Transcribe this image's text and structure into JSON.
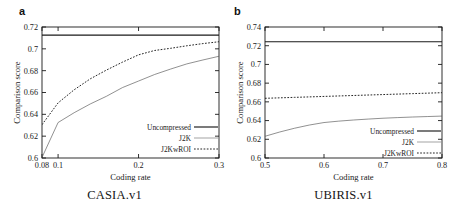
{
  "figure": {
    "panels": [
      {
        "letter": "a",
        "caption": "CASIA.v1",
        "chart_data": {
          "type": "line",
          "title": "",
          "xlabel": "Coding rate",
          "ylabel": "Comparison score",
          "xlim": [
            0.08,
            0.3
          ],
          "ylim": [
            0.6,
            0.72
          ],
          "xticks": [
            0.08,
            0.1,
            0.2,
            0.3
          ],
          "xticklabels": [
            "0.08",
            "0.1",
            "0.2",
            "0.3"
          ],
          "yticks": [
            0.6,
            0.62,
            0.64,
            0.66,
            0.68,
            0.7,
            0.72
          ],
          "yticklabels": [
            "0.6",
            "0.62",
            "0.64",
            "0.66",
            "0.68",
            "0.7",
            "0.72"
          ],
          "grid": false,
          "legend_position": "lower right",
          "series": [
            {
              "name": "Uncompressed",
              "style": "solid",
              "x": [
                0.08,
                0.3
              ],
              "values": [
                0.7125,
                0.7125
              ]
            },
            {
              "name": "J2K",
              "style": "thin-solid",
              "x": [
                0.08,
                0.1,
                0.12,
                0.14,
                0.16,
                0.18,
                0.2,
                0.22,
                0.24,
                0.26,
                0.28,
                0.3
              ],
              "values": [
                0.6005,
                0.6325,
                0.6415,
                0.6495,
                0.6565,
                0.6645,
                0.6705,
                0.6765,
                0.6815,
                0.6862,
                0.6898,
                0.6932
              ]
            },
            {
              "name": "J2KwROI",
              "style": "dotted",
              "x": [
                0.08,
                0.1,
                0.12,
                0.14,
                0.16,
                0.18,
                0.2,
                0.22,
                0.24,
                0.26,
                0.28,
                0.3
              ],
              "values": [
                0.6305,
                0.6505,
                0.6625,
                0.6725,
                0.6805,
                0.6878,
                0.6945,
                0.6985,
                0.7005,
                0.7028,
                0.7048,
                0.7065
              ]
            }
          ]
        }
      },
      {
        "letter": "b",
        "caption": "UBIRIS.v1",
        "chart_data": {
          "type": "line",
          "title": "",
          "xlabel": "Coding rate",
          "ylabel": "Comparison score",
          "xlim": [
            0.5,
            0.8
          ],
          "ylim": [
            0.6,
            0.74
          ],
          "xticks": [
            0.5,
            0.6,
            0.7,
            0.8
          ],
          "xticklabels": [
            "0.5",
            "0.6",
            "0.7",
            "0.8"
          ],
          "yticks": [
            0.6,
            0.62,
            0.64,
            0.66,
            0.68,
            0.7,
            0.72,
            0.74
          ],
          "yticklabels": [
            "0.6",
            "0.62",
            "0.64",
            "0.66",
            "0.68",
            "0.7",
            "0.72",
            "0.74"
          ],
          "grid": false,
          "legend_position": "lower right",
          "series": [
            {
              "name": "Uncompressed",
              "style": "solid",
              "x": [
                0.5,
                0.8
              ],
              "values": [
                0.7242,
                0.7242
              ]
            },
            {
              "name": "J2K",
              "style": "thin-solid",
              "x": [
                0.5,
                0.525,
                0.55,
                0.575,
                0.6,
                0.625,
                0.65,
                0.675,
                0.7,
                0.725,
                0.75,
                0.775,
                0.8
              ],
              "values": [
                0.6232,
                0.6278,
                0.6318,
                0.6352,
                0.6379,
                0.6394,
                0.6406,
                0.6416,
                0.6425,
                0.6432,
                0.6438,
                0.6443,
                0.6448
              ]
            },
            {
              "name": "J2KwROI",
              "style": "dotted",
              "x": [
                0.5,
                0.55,
                0.6,
                0.65,
                0.7,
                0.75,
                0.8
              ],
              "values": [
                0.6638,
                0.6648,
                0.6658,
                0.6668,
                0.6678,
                0.6688,
                0.6698
              ]
            }
          ]
        }
      }
    ],
    "legend_labels": {
      "uncompressed": "Uncompressed",
      "j2k": "J2K",
      "j2kwroi": "J2KwROI"
    }
  }
}
